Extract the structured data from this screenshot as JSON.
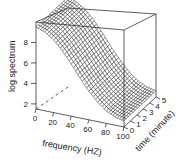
{
  "chart_data": {
    "type": "surface3d",
    "title": "",
    "xlabel": "frequency (HZ)",
    "ylabel": "time (minute)",
    "zlabel": "log spectrum",
    "x_ticks": [
      "0",
      "20",
      "40",
      "60",
      "80",
      "100"
    ],
    "y_ticks": [
      "0",
      "1",
      "2",
      "3",
      "4",
      "5"
    ],
    "z_ticks": [
      "2",
      "4",
      "6",
      "8"
    ],
    "xlim": [
      0,
      100
    ],
    "ylim": [
      0,
      5
    ],
    "zlim": [
      1.5,
      10
    ],
    "surface": {
      "description": "log spectrum decays roughly exponentially with frequency, nearly constant across time",
      "frequency": [
        0,
        10,
        20,
        30,
        40,
        50,
        60,
        70,
        80,
        90,
        100
      ],
      "log_spectrum_at_time0": [
        9.5,
        9.2,
        8.6,
        7.7,
        6.6,
        5.4,
        4.3,
        3.4,
        2.7,
        2.3,
        2.1
      ]
    },
    "grid": false,
    "legend": null
  },
  "axes": {
    "z_label": "log spectrum",
    "x_label": "frequency (HZ)",
    "y_label": "time (minute)"
  }
}
